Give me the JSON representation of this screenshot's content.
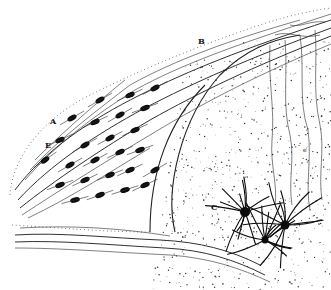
{
  "figure": {
    "labels": [
      {
        "id": "A",
        "text": "A"
      },
      {
        "id": "B",
        "text": "B"
      },
      {
        "id": "C",
        "text": "C"
      },
      {
        "id": "E",
        "text": "E"
      },
      {
        "id": "e",
        "text": "e"
      }
    ],
    "colors": {
      "ink": "#111111",
      "paper": "#ffffff"
    }
  }
}
